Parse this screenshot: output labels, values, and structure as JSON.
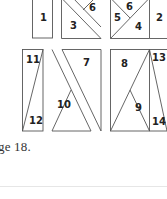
{
  "figure": {
    "stroke_color": "#555555",
    "pieces": [
      {
        "id": "1",
        "label": "1"
      },
      {
        "id": "2",
        "label": "2"
      },
      {
        "id": "3",
        "label": "3"
      },
      {
        "id": "4",
        "label": "4"
      },
      {
        "id": "5",
        "label": "5"
      },
      {
        "id": "6a",
        "label": "6"
      },
      {
        "id": "6b",
        "label": "6"
      },
      {
        "id": "7",
        "label": "7"
      },
      {
        "id": "8",
        "label": "8"
      },
      {
        "id": "9",
        "label": "9"
      },
      {
        "id": "10",
        "label": "10"
      },
      {
        "id": "11",
        "label": "11"
      },
      {
        "id": "12",
        "label": "12"
      },
      {
        "id": "13",
        "label": "13"
      },
      {
        "id": "14",
        "label": "14"
      }
    ]
  },
  "caption": {
    "text": "ge 18."
  }
}
